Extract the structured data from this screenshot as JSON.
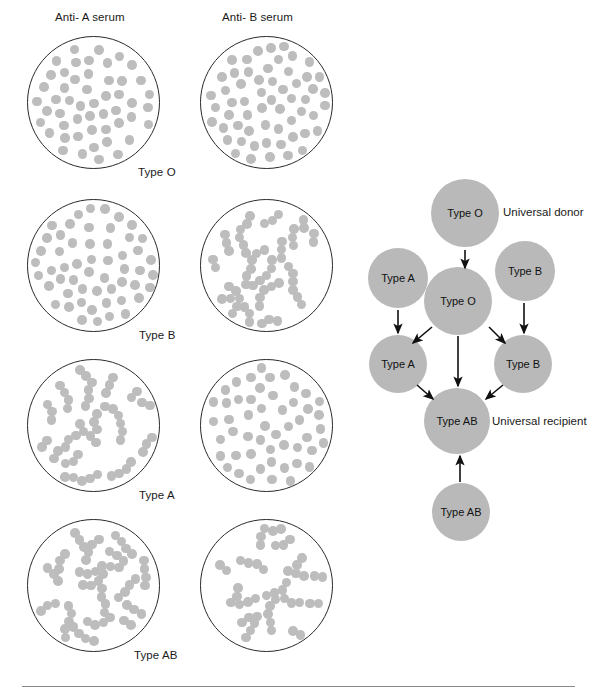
{
  "figure": {
    "title_note": "Blood typing agglutination test results and transfusion compatibility diagram",
    "background_color": "#ffffff",
    "cell_color": "#bdbdbd",
    "node_color": "#b9b9b9",
    "outline_color": "#2a2a2a"
  },
  "agglutination_panel": {
    "column_headers": [
      {
        "id": "anti-a",
        "label": "Anti- A serum",
        "x": 55,
        "y": 11
      },
      {
        "id": "anti-b",
        "label": "Anti- B serum",
        "x": 222,
        "y": 11
      }
    ],
    "rows": [
      {
        "blood_type": "Type O",
        "caption": "Type O",
        "caption_x": 138,
        "caption_y": 166,
        "dish_top": 36,
        "results": [
          {
            "serum": "Anti- A serum",
            "agglutinated": false,
            "pattern": "scattered"
          },
          {
            "serum": "Anti- B serum",
            "agglutinated": false,
            "pattern": "scattered"
          }
        ]
      },
      {
        "blood_type": "Type B",
        "caption": "Type B",
        "caption_x": 139,
        "caption_y": 329,
        "dish_top": 199,
        "results": [
          {
            "serum": "Anti- A serum",
            "agglutinated": false,
            "pattern": "scattered"
          },
          {
            "serum": "Anti- B serum",
            "agglutinated": true,
            "pattern": "clumped"
          }
        ]
      },
      {
        "blood_type": "Type A",
        "caption": "Type A",
        "caption_x": 139,
        "caption_y": 489,
        "dish_top": 359,
        "results": [
          {
            "serum": "Anti- A serum",
            "agglutinated": true,
            "pattern": "clumped"
          },
          {
            "serum": "Anti- B serum",
            "agglutinated": false,
            "pattern": "scattered"
          }
        ]
      },
      {
        "blood_type": "Type AB",
        "caption": "Type AB",
        "caption_x": 134,
        "caption_y": 649,
        "dish_top": 519,
        "results": [
          {
            "serum": "Anti- A serum",
            "agglutinated": true,
            "pattern": "clumped"
          },
          {
            "serum": "Anti- B serum",
            "agglutinated": true,
            "pattern": "clumped"
          }
        ]
      }
    ],
    "dish_geometry": {
      "left_column_x": 27,
      "right_column_x": 200,
      "diameter": 133
    }
  },
  "transfusion_diagram": {
    "nodes": [
      {
        "id": "donor-o",
        "label": "Type O",
        "cx": 465,
        "cy": 213,
        "r": 34
      },
      {
        "id": "donor-a",
        "label": "Type A",
        "cx": 398,
        "cy": 278,
        "r": 30
      },
      {
        "id": "donor-b",
        "label": "Type B",
        "cx": 525,
        "cy": 271,
        "r": 30
      },
      {
        "id": "recipient-o",
        "label": "Type O",
        "cx": 458,
        "cy": 301,
        "r": 34
      },
      {
        "id": "recipient-a",
        "label": "Type A",
        "cx": 398,
        "cy": 364,
        "r": 29
      },
      {
        "id": "recipient-b",
        "label": "Type B",
        "cx": 523,
        "cy": 364,
        "r": 29
      },
      {
        "id": "recipient-ab",
        "label": "Type AB",
        "cx": 457,
        "cy": 421,
        "r": 33
      },
      {
        "id": "donor-ab",
        "label": "Type AB",
        "cx": 461,
        "cy": 512,
        "r": 29
      }
    ],
    "annotations": [
      {
        "id": "universal-donor",
        "label": "Universal donor",
        "x": 503,
        "y": 206
      },
      {
        "id": "universal-recipient",
        "label": "Universal recipient",
        "x": 492,
        "y": 415
      }
    ],
    "arrows": [
      {
        "from": "donor-o",
        "to": "recipient-o",
        "x1": 465,
        "y1": 250,
        "x2": 465,
        "y2": 268
      },
      {
        "from": "donor-a",
        "to": "recipient-a",
        "x1": 398,
        "y1": 310,
        "x2": 398,
        "y2": 333
      },
      {
        "from": "donor-b",
        "to": "recipient-b",
        "x1": 524,
        "y1": 303,
        "x2": 524,
        "y2": 333
      },
      {
        "from": "recipient-o",
        "to": "recipient-a",
        "x1": 432,
        "y1": 327,
        "x2": 413,
        "y2": 343
      },
      {
        "from": "recipient-o",
        "to": "recipient-b",
        "x1": 489,
        "y1": 327,
        "x2": 505,
        "y2": 343
      },
      {
        "from": "recipient-o",
        "to": "recipient-ab",
        "x1": 458,
        "y1": 336,
        "x2": 458,
        "y2": 386
      },
      {
        "from": "recipient-a",
        "to": "recipient-ab",
        "x1": 417,
        "y1": 385,
        "x2": 433,
        "y2": 399
      },
      {
        "from": "recipient-b",
        "to": "recipient-ab",
        "x1": 503,
        "y1": 385,
        "x2": 486,
        "y2": 399
      },
      {
        "from": "donor-ab",
        "to": "recipient-ab",
        "x1": 460,
        "y1": 482,
        "x2": 460,
        "y2": 456
      }
    ]
  },
  "footer_rule": {
    "x": 22,
    "y": 686,
    "width": 553
  }
}
